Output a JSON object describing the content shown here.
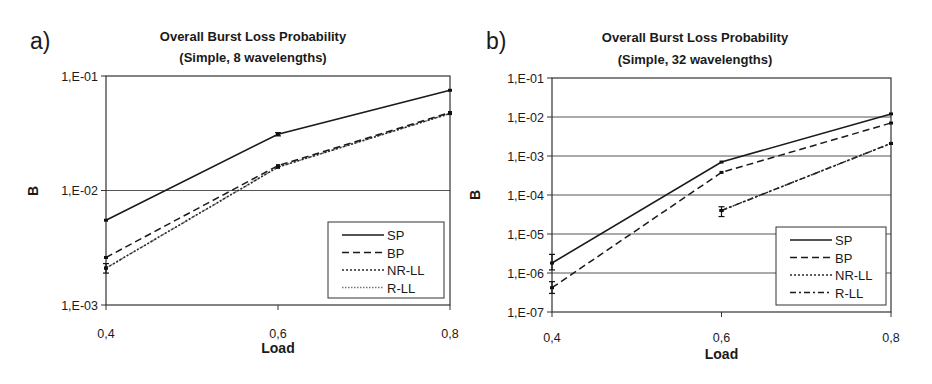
{
  "chart_data": [
    {
      "panel_label": "a)",
      "type": "line",
      "title": "Overall Burst Loss Probability",
      "subtitle": "(Simple, 8 wavelengths)",
      "xlabel": "Load",
      "ylabel": "B",
      "yscale": "log",
      "ylim": [
        0.001,
        0.1
      ],
      "xlim": [
        0.4,
        0.8
      ],
      "x_ticks": [
        "0,4",
        "0,6",
        "0,8"
      ],
      "y_ticks": [
        "1,E-01",
        "1,E-02",
        "1,E-03"
      ],
      "grid": "horizontal major",
      "legend_position": "lower right",
      "x": [
        0.4,
        0.6,
        0.8
      ],
      "series": [
        {
          "name": "SP",
          "style": "solid",
          "values": [
            0.0055,
            0.031,
            0.075
          ]
        },
        {
          "name": "BP",
          "style": "dashed",
          "values": [
            0.0026,
            0.0165,
            0.048
          ]
        },
        {
          "name": "NR-LL",
          "style": "dotted",
          "values": [
            0.0021,
            0.016,
            0.047
          ]
        },
        {
          "name": "R-LL",
          "style": "fine-dotted",
          "values": [
            0.0021,
            0.016,
            0.047
          ]
        }
      ]
    },
    {
      "panel_label": "b)",
      "type": "line",
      "title": "Overall Burst Loss Probability",
      "subtitle": "(Simple, 32 wavelengths)",
      "xlabel": "Load",
      "ylabel": "B",
      "yscale": "log",
      "ylim": [
        1e-07,
        0.1
      ],
      "xlim": [
        0.4,
        0.8
      ],
      "x_ticks": [
        "0,4",
        "0,6",
        "0,8"
      ],
      "y_ticks": [
        "1,E-01",
        "1,E-02",
        "1,E-03",
        "1,E-04",
        "1,E-05",
        "1,E-06",
        "1,E-07"
      ],
      "grid": "horizontal major",
      "legend_position": "lower right",
      "x": [
        0.4,
        0.6,
        0.8
      ],
      "series": [
        {
          "name": "SP",
          "style": "solid",
          "values": [
            1.8e-06,
            0.0007,
            0.012
          ]
        },
        {
          "name": "BP",
          "style": "dashed",
          "values": [
            4.2e-07,
            0.00038,
            0.007
          ]
        },
        {
          "name": "NR-LL",
          "style": "dotted",
          "values": [
            null,
            4e-05,
            0.0021
          ]
        },
        {
          "name": "R-LL",
          "style": "dash-dot",
          "values": [
            null,
            4e-05,
            0.0021
          ]
        }
      ]
    }
  ],
  "layout": {
    "panels": [
      {
        "plot": {
          "x0": 106,
          "x1": 450,
          "y_top": 76,
          "y_bottom": 305
        },
        "label_pos": [
          30,
          49
        ],
        "title_cx": 253,
        "title_y": [
          41,
          62
        ],
        "legend": {
          "x": 328,
          "y": 222,
          "w": 116,
          "h": 76
        },
        "ylabel_pos": [
          38,
          191
        ],
        "xlabel_y": 353,
        "xtick_y": 338,
        "dash": {
          "solid": "",
          "dashed": "7,4",
          "dotted": "2,2",
          "fine-dotted": "1.5,1.5",
          "dash-dot": "6,3,2,3"
        },
        "colors": {
          "SP": "#1a1a1a",
          "BP": "#1a1a1a",
          "NR-LL": "#2a2a2a",
          "R-LL": "#777777"
        },
        "errorbars": [
          [
            0.4,
            0.0019,
            0.0023
          ],
          [
            0.6,
            0.03,
            0.032
          ]
        ]
      },
      {
        "plot": {
          "x0": 552,
          "x1": 891,
          "y_top": 78,
          "y_bottom": 312
        },
        "label_pos": [
          486,
          49
        ],
        "title_cx": 695,
        "title_y": [
          42,
          64
        ],
        "legend": {
          "x": 776,
          "y": 227,
          "w": 110,
          "h": 78
        },
        "ylabel_pos": [
          480,
          195
        ],
        "xlabel_y": 359,
        "xtick_y": 342,
        "dash": {
          "solid": "",
          "dashed": "7,4",
          "dotted": "2,2",
          "fine-dotted": "1.5,1.5",
          "dash-dot": "6,3,2,3"
        },
        "colors": {
          "SP": "#1a1a1a",
          "BP": "#1a1a1a",
          "NR-LL": "#2a2a2a",
          "R-LL": "#1a1a1a"
        },
        "errorbars": [
          [
            0.4,
            1.2e-06,
            3e-06
          ],
          [
            0.4,
            3e-07,
            6e-07
          ],
          [
            0.6,
            2.8e-05,
            5e-05
          ]
        ]
      }
    ]
  }
}
